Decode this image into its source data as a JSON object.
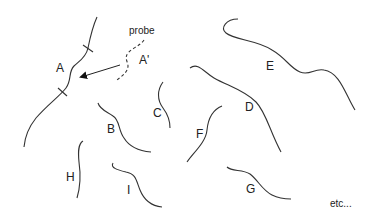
{
  "diagram": {
    "background": "#ffffff",
    "stroke_color": "#333333",
    "probe": {
      "label": "probe",
      "strand_label": "A'",
      "style": "dashed"
    },
    "target": {
      "label": "A",
      "note": "probe A' hybridizes to fragment A between two tick marks"
    },
    "fragments": [
      {
        "id": "A",
        "label": "A"
      },
      {
        "id": "B",
        "label": "B"
      },
      {
        "id": "C",
        "label": "C"
      },
      {
        "id": "D",
        "label": "D"
      },
      {
        "id": "E",
        "label": "E"
      },
      {
        "id": "F",
        "label": "F"
      },
      {
        "id": "G",
        "label": "G"
      },
      {
        "id": "H",
        "label": "H"
      },
      {
        "id": "I",
        "label": "I"
      }
    ],
    "footer_text": "etc..."
  }
}
